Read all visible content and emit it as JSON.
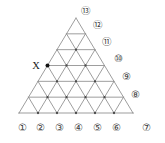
{
  "figure": {
    "name": "triangular-lattice",
    "width": 165,
    "height": 143,
    "background_color": "#ffffff",
    "line_color": "#8c8c8c",
    "vertex_dot_color": "#4a4a4a",
    "marker_color": "#111111",
    "label_color": "#3a3a3a",
    "rows": 6,
    "apex": {
      "x": 76,
      "y": 18
    },
    "base_left": {
      "x": 19,
      "y": 113
    },
    "base_right": {
      "x": 133,
      "y": 113
    }
  },
  "marker": {
    "label": "X",
    "label_x": 36,
    "label_y": 66,
    "dot_x": 47.5,
    "dot_y": 65.5,
    "dot_radius": 2.0
  },
  "labels": [
    {
      "id": "label-1",
      "text": "①",
      "x": 22,
      "y": 129
    },
    {
      "id": "label-2",
      "text": "②",
      "x": 40,
      "y": 129
    },
    {
      "id": "label-3",
      "text": "③",
      "x": 59,
      "y": 129
    },
    {
      "id": "label-4",
      "text": "④",
      "x": 78,
      "y": 129
    },
    {
      "id": "label-5",
      "text": "⑤",
      "x": 97,
      "y": 129
    },
    {
      "id": "label-6",
      "text": "⑥",
      "x": 116,
      "y": 129
    },
    {
      "id": "label-7",
      "text": "⑦",
      "x": 146,
      "y": 129
    },
    {
      "id": "label-8",
      "text": "⑧",
      "x": 135,
      "y": 96
    },
    {
      "id": "label-9",
      "text": "⑨",
      "x": 126,
      "y": 78
    },
    {
      "id": "label-10",
      "text": "⑩",
      "x": 118,
      "y": 60
    },
    {
      "id": "label-11",
      "text": "⑪",
      "x": 107,
      "y": 43
    },
    {
      "id": "label-12",
      "text": "⑫",
      "x": 98,
      "y": 26
    },
    {
      "id": "label-13",
      "text": "⑬",
      "x": 86,
      "y": 12
    }
  ],
  "chart_data": {
    "type": "diagram",
    "subtype": "triangular-lattice",
    "title": "",
    "lattice_rows": 6,
    "small_triangles_total": 36,
    "perimeter_labels": [
      "①",
      "②",
      "③",
      "④",
      "⑤",
      "⑥",
      "⑦",
      "⑧",
      "⑨",
      "⑩",
      "⑪",
      "⑫",
      "⑬"
    ],
    "bottom_edge_labels": [
      "①",
      "②",
      "③",
      "④",
      "⑤",
      "⑥",
      "⑦"
    ],
    "right_edge_labels": [
      "⑧",
      "⑨",
      "⑩",
      "⑪",
      "⑫",
      "⑬"
    ],
    "marked_points": [
      {
        "label": "X",
        "edge": "left",
        "row_from_apex": 3
      }
    ]
  }
}
